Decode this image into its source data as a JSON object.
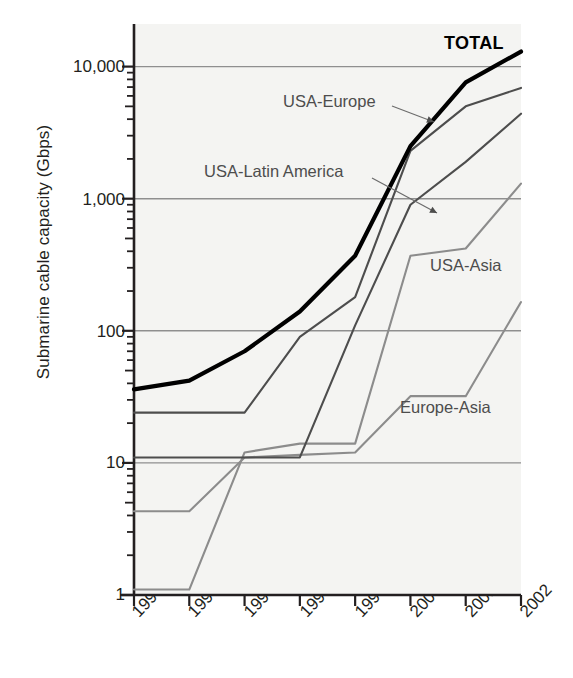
{
  "chart_data": {
    "type": "line",
    "title": "",
    "xlabel": "",
    "ylabel": "Submarine cable capacity (Gbps)",
    "yscale": "log",
    "ylim": [
      1,
      20000
    ],
    "ytick_labels": [
      "10,000",
      "1,000",
      "100",
      "10",
      "1"
    ],
    "ytick_values": [
      10000,
      1000,
      100,
      10,
      1
    ],
    "grid": "horizontal",
    "legend": "inline-annotations",
    "categories": [
      "1995",
      "1996",
      "1997",
      "1998",
      "1999",
      "2000",
      "2001",
      "2002"
    ],
    "x": [
      1995,
      1996,
      1997,
      1998,
      1999,
      2000,
      2001,
      2002
    ],
    "series": [
      {
        "name": "TOTAL",
        "color": "#000000",
        "width": 4.2,
        "label_x": 444,
        "label_y": 33,
        "values": [
          36,
          42,
          70,
          140,
          370,
          2500,
          7600,
          13000
        ]
      },
      {
        "name": "USA-Europe",
        "color": "#4d4d4d",
        "width": 2.1,
        "label_x": 283,
        "label_y": 92,
        "leader": "283,112 to 434,122",
        "values": [
          24,
          24,
          24,
          90,
          180,
          2300,
          5000,
          6900
        ]
      },
      {
        "name": "USA-Latin America",
        "color": "#4d4d4d",
        "width": 2.1,
        "label_x": 204,
        "label_y": 162,
        "leader": "204,182 to 437,212",
        "values": [
          11,
          11,
          11,
          11,
          110,
          900,
          1900,
          4400
        ]
      },
      {
        "name": "USA-Asia",
        "color": "#8c8c8c",
        "width": 2.1,
        "label_x": 430,
        "label_y": 256,
        "values": [
          1.1,
          1.1,
          12,
          14,
          14,
          370,
          420,
          1300
        ]
      },
      {
        "name": "Europe-Asia",
        "color": "#8c8c8c",
        "width": 2.1,
        "label_x": 400,
        "label_y": 398,
        "values": [
          4.3,
          4.3,
          11,
          11.5,
          12,
          32,
          32,
          165
        ]
      }
    ]
  },
  "colors": {
    "plot_background": "#f4f4f2",
    "axis": "#231f20",
    "gridline": "#8f8f8f",
    "total": "#000000",
    "dark_series": "#4d4d4d",
    "light_series": "#8c8c8c"
  }
}
